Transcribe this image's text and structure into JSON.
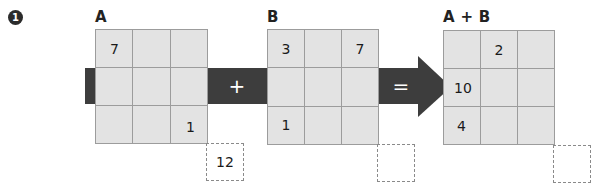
{
  "problem": {
    "number": "1",
    "operators": {
      "plus": "+",
      "equals": "="
    },
    "matrices": [
      {
        "label": "A",
        "cells": [
          [
            "7",
            "",
            ""
          ],
          [
            "",
            "",
            ""
          ],
          [
            "",
            "",
            "1"
          ]
        ],
        "answer_box": "12"
      },
      {
        "label": "B",
        "cells": [
          [
            "3",
            "",
            "7"
          ],
          [
            "",
            "",
            ""
          ],
          [
            "1",
            "",
            ""
          ]
        ],
        "answer_box": ""
      },
      {
        "label": "A + B",
        "cells": [
          [
            "",
            "2",
            ""
          ],
          [
            "10",
            "",
            ""
          ],
          [
            "4",
            "",
            ""
          ]
        ],
        "answer_box": ""
      }
    ]
  },
  "colors": {
    "band": "#3d3d3d",
    "cell_fill": "#e3e3e3",
    "grid_line": "#9c9c9c",
    "dash_border": "#8a8a8a"
  }
}
